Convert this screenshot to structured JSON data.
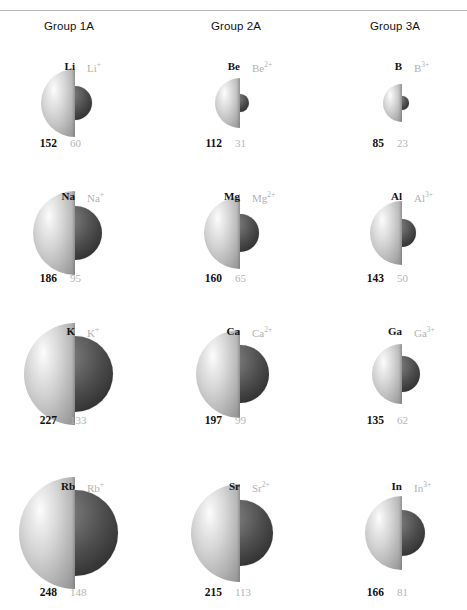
{
  "figure": {
    "cut_header_text": "",
    "columns": [
      {
        "id": "group1a",
        "label": "Group 1A",
        "x": 44
      },
      {
        "id": "group2a",
        "label": "Group 2A",
        "x": 211
      },
      {
        "id": "group3a",
        "label": "Group 3A",
        "x": 370
      }
    ]
  },
  "chart_data": {
    "type": "diagram",
    "units": "pm",
    "legend": {
      "neutral_atom": "dark bold value = neutral atomic radius",
      "cation": "light gray value = cation ionic radius"
    },
    "groups": [
      {
        "name": "Group 1A",
        "charge": "1+",
        "elements": [
          {
            "atom_label": "Li",
            "ion_symbol": "Li",
            "ion_charge": "+",
            "atom_radius": 152,
            "ion_radius": 60
          },
          {
            "atom_label": "Na",
            "ion_symbol": "Na",
            "ion_charge": "+",
            "atom_radius": 186,
            "ion_radius": 95
          },
          {
            "atom_label": "K",
            "ion_symbol": "K",
            "ion_charge": "+",
            "atom_radius": 227,
            "ion_radius": 133
          },
          {
            "atom_label": "Rb",
            "ion_symbol": "Rb",
            "ion_charge": "+",
            "atom_radius": 248,
            "ion_radius": 148
          }
        ]
      },
      {
        "name": "Group 2A",
        "charge": "2+",
        "elements": [
          {
            "atom_label": "Be",
            "ion_symbol": "Be",
            "ion_charge": "2+",
            "atom_radius": 112,
            "ion_radius": 31
          },
          {
            "atom_label": "Mg",
            "ion_symbol": "Mg",
            "ion_charge": "2+",
            "atom_radius": 160,
            "ion_radius": 65
          },
          {
            "atom_label": "Ca",
            "ion_symbol": "Ca",
            "ion_charge": "2+",
            "atom_radius": 197,
            "ion_radius": 99
          },
          {
            "atom_label": "Sr",
            "ion_symbol": "Sr",
            "ion_charge": "2+",
            "atom_radius": 215,
            "ion_radius": 113
          }
        ]
      },
      {
        "name": "Group 3A",
        "charge": "3+",
        "elements": [
          {
            "atom_label": "B",
            "ion_symbol": "B",
            "ion_charge": "3+",
            "atom_radius": 85,
            "ion_radius": 23
          },
          {
            "atom_label": "Al",
            "ion_symbol": "Al",
            "ion_charge": "3+",
            "atom_radius": 143,
            "ion_radius": 50
          },
          {
            "atom_label": "Ga",
            "ion_symbol": "Ga",
            "ion_charge": "3+",
            "atom_radius": 135,
            "ion_radius": 62
          },
          {
            "atom_label": "In",
            "ion_symbol": "In",
            "ion_charge": "3+",
            "atom_radius": 166,
            "ion_radius": 81
          }
        ]
      }
    ]
  },
  "layout": {
    "row_centers_y": [
      103,
      233,
      374,
      533
    ],
    "row_label_y": [
      60,
      190,
      325,
      480
    ],
    "row_number_y": [
      137,
      272,
      414,
      586
    ],
    "column_center_x": [
      75,
      240,
      402
    ],
    "colors": {
      "atom_light": "#d5d5d5",
      "ion_dark": "#4d4d4d",
      "atom_text": "#111111",
      "ion_text": "#b5b5b5",
      "rule": "#b9b9b9"
    }
  }
}
